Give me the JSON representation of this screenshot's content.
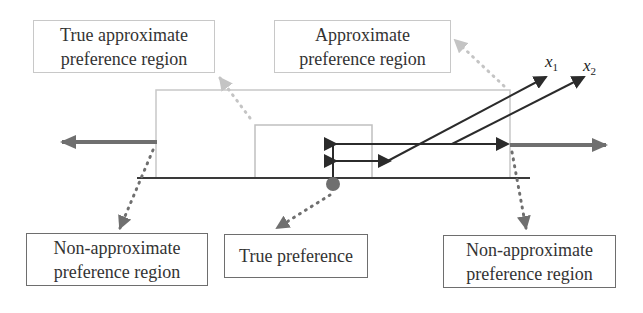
{
  "diagram": {
    "labels": {
      "true_approx_region": [
        "True approximate",
        "preference region"
      ],
      "approx_region": [
        "Approximate",
        "preference region"
      ],
      "non_approx_left": [
        "Non-approximate",
        "preference region"
      ],
      "true_preference": [
        "True preference"
      ],
      "non_approx_right": [
        "Non-approximate",
        "preference region"
      ]
    },
    "variables": {
      "x1": {
        "base": "x",
        "sub": "1"
      },
      "x2": {
        "base": "x",
        "sub": "2"
      }
    },
    "colors": {
      "dark_line": "#2b2b2b",
      "gray_arrow": "#6f6f6f",
      "light_arrow": "#c4c4c4",
      "box_border": "#9a9a9a"
    }
  }
}
